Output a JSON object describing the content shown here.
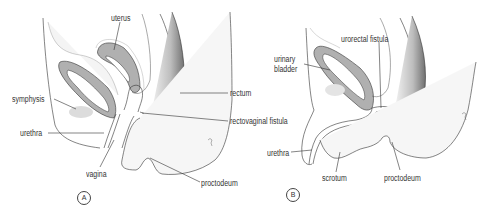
{
  "figure": {
    "panel_a": {
      "marker": "A",
      "labels": {
        "uterus": "uterus",
        "symphysis": "symphysis",
        "urethra": "urethra",
        "vagina": "vagina",
        "rectum": "rectum",
        "rectovaginal_fistula": "rectovaginal fistula",
        "proctodeum": "proctodeum"
      }
    },
    "panel_b": {
      "marker": "B",
      "labels": {
        "urinary_bladder_line1": "urinary",
        "urinary_bladder_line2": "bladder",
        "urorectal_fistula": "urorectal fistula",
        "urethra": "urethra",
        "scrotum": "scrotum",
        "proctodeum": "proctodeum"
      }
    },
    "colors": {
      "line": "#333333",
      "organ_fill": "#a9a9a9",
      "tissue_fill": "#f2f2f2",
      "rectum_shade": "#8a8a8a"
    }
  }
}
